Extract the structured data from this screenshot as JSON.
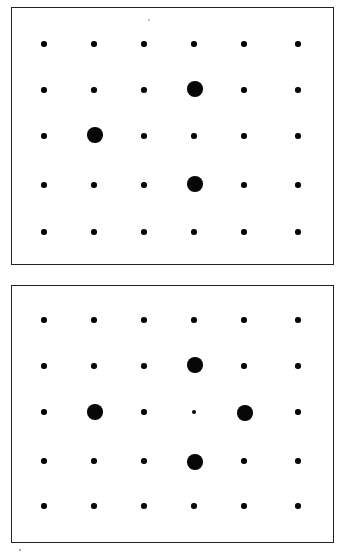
{
  "figure": {
    "title": "Two-panel dot lattice diagram",
    "background_color": "#ffffff",
    "dot_color": "#070707",
    "border_color": "#232323",
    "width": 346,
    "height": 560,
    "panel_count": 2,
    "grid_rows": 5,
    "grid_columns": 6
  },
  "panels": [
    {
      "id": "panel-top",
      "label": "Top panel",
      "frame": {
        "x": 11,
        "y": 7,
        "width": 323,
        "height": 258
      },
      "columns_x": [
        44,
        94,
        144,
        194,
        244,
        298
      ],
      "rows_y": [
        44,
        91,
        138,
        187,
        232
      ],
      "small_dot_diameter": 5.4,
      "large_dot_diameter": 15.5,
      "dots": [
        {
          "row": 1,
          "col": 1,
          "x": 44,
          "y": 44,
          "size": "small"
        },
        {
          "row": 1,
          "col": 2,
          "x": 94,
          "y": 44,
          "size": "small"
        },
        {
          "row": 1,
          "col": 3,
          "x": 144,
          "y": 44,
          "size": "small"
        },
        {
          "row": 1,
          "col": 4,
          "x": 194,
          "y": 44,
          "size": "small"
        },
        {
          "row": 1,
          "col": 5,
          "x": 244,
          "y": 44,
          "size": "small"
        },
        {
          "row": 1,
          "col": 6,
          "x": 298,
          "y": 44,
          "size": "small"
        },
        {
          "row": 2,
          "col": 1,
          "x": 44,
          "y": 90,
          "size": "small"
        },
        {
          "row": 2,
          "col": 2,
          "x": 94,
          "y": 90,
          "size": "small"
        },
        {
          "row": 2,
          "col": 3,
          "x": 144,
          "y": 90,
          "size": "small"
        },
        {
          "row": 2,
          "col": 4,
          "x": 195,
          "y": 89,
          "size": "large"
        },
        {
          "row": 2,
          "col": 5,
          "x": 244,
          "y": 90,
          "size": "small"
        },
        {
          "row": 2,
          "col": 6,
          "x": 298,
          "y": 90,
          "size": "small"
        },
        {
          "row": 3,
          "col": 1,
          "x": 44,
          "y": 136,
          "size": "small"
        },
        {
          "row": 3,
          "col": 2,
          "x": 95,
          "y": 135,
          "size": "large"
        },
        {
          "row": 3,
          "col": 3,
          "x": 144,
          "y": 136,
          "size": "small"
        },
        {
          "row": 3,
          "col": 4,
          "x": 194,
          "y": 136,
          "size": "small"
        },
        {
          "row": 3,
          "col": 5,
          "x": 244,
          "y": 136,
          "size": "small"
        },
        {
          "row": 3,
          "col": 6,
          "x": 298,
          "y": 136,
          "size": "small"
        },
        {
          "row": 4,
          "col": 1,
          "x": 44,
          "y": 185,
          "size": "small"
        },
        {
          "row": 4,
          "col": 2,
          "x": 94,
          "y": 185,
          "size": "small"
        },
        {
          "row": 4,
          "col": 3,
          "x": 144,
          "y": 185,
          "size": "small"
        },
        {
          "row": 4,
          "col": 4,
          "x": 195,
          "y": 184,
          "size": "large"
        },
        {
          "row": 4,
          "col": 5,
          "x": 244,
          "y": 185,
          "size": "small"
        },
        {
          "row": 4,
          "col": 6,
          "x": 298,
          "y": 185,
          "size": "small"
        },
        {
          "row": 5,
          "col": 1,
          "x": 44,
          "y": 232,
          "size": "small"
        },
        {
          "row": 5,
          "col": 2,
          "x": 94,
          "y": 232,
          "size": "small"
        },
        {
          "row": 5,
          "col": 3,
          "x": 144,
          "y": 232,
          "size": "small"
        },
        {
          "row": 5,
          "col": 4,
          "x": 194,
          "y": 232,
          "size": "small"
        },
        {
          "row": 5,
          "col": 5,
          "x": 244,
          "y": 232,
          "size": "small"
        },
        {
          "row": 5,
          "col": 6,
          "x": 298,
          "y": 232,
          "size": "small"
        }
      ],
      "large_dot_positions": [
        {
          "row": 2,
          "col": 4
        },
        {
          "row": 3,
          "col": 2
        },
        {
          "row": 4,
          "col": 4
        }
      ],
      "large_dot_count": 3
    },
    {
      "id": "panel-bottom",
      "label": "Bottom panel",
      "frame": {
        "x": 11,
        "y": 285,
        "width": 323,
        "height": 258
      },
      "columns_x": [
        44,
        94,
        144,
        194,
        244,
        298
      ],
      "rows_y": [
        320,
        366,
        412,
        461,
        506
      ],
      "small_dot_diameter": 5.4,
      "large_dot_diameter": 15.5,
      "dots": [
        {
          "row": 1,
          "col": 1,
          "x": 44,
          "y": 320,
          "size": "small"
        },
        {
          "row": 1,
          "col": 2,
          "x": 94,
          "y": 320,
          "size": "small"
        },
        {
          "row": 1,
          "col": 3,
          "x": 144,
          "y": 320,
          "size": "small"
        },
        {
          "row": 1,
          "col": 4,
          "x": 194,
          "y": 320,
          "size": "small"
        },
        {
          "row": 1,
          "col": 5,
          "x": 244,
          "y": 320,
          "size": "small"
        },
        {
          "row": 1,
          "col": 6,
          "x": 298,
          "y": 320,
          "size": "small"
        },
        {
          "row": 2,
          "col": 1,
          "x": 44,
          "y": 366,
          "size": "small"
        },
        {
          "row": 2,
          "col": 2,
          "x": 94,
          "y": 366,
          "size": "small"
        },
        {
          "row": 2,
          "col": 3,
          "x": 144,
          "y": 366,
          "size": "small"
        },
        {
          "row": 2,
          "col": 4,
          "x": 195,
          "y": 365,
          "size": "large"
        },
        {
          "row": 2,
          "col": 5,
          "x": 244,
          "y": 366,
          "size": "small"
        },
        {
          "row": 2,
          "col": 6,
          "x": 298,
          "y": 366,
          "size": "small"
        },
        {
          "row": 3,
          "col": 1,
          "x": 44,
          "y": 412,
          "size": "small"
        },
        {
          "row": 3,
          "col": 2,
          "x": 95,
          "y": 412,
          "size": "large"
        },
        {
          "row": 3,
          "col": 3,
          "x": 144,
          "y": 412,
          "size": "small"
        },
        {
          "row": 3,
          "col": 4,
          "x": 194,
          "y": 412,
          "size": "tiny"
        },
        {
          "row": 3,
          "col": 5,
          "x": 245,
          "y": 413,
          "size": "large"
        },
        {
          "row": 3,
          "col": 6,
          "x": 298,
          "y": 412,
          "size": "small"
        },
        {
          "row": 4,
          "col": 1,
          "x": 44,
          "y": 461,
          "size": "small"
        },
        {
          "row": 4,
          "col": 2,
          "x": 94,
          "y": 461,
          "size": "small"
        },
        {
          "row": 4,
          "col": 3,
          "x": 144,
          "y": 461,
          "size": "small"
        },
        {
          "row": 4,
          "col": 4,
          "x": 195,
          "y": 462,
          "size": "large"
        },
        {
          "row": 4,
          "col": 5,
          "x": 244,
          "y": 461,
          "size": "small"
        },
        {
          "row": 4,
          "col": 6,
          "x": 298,
          "y": 461,
          "size": "small"
        },
        {
          "row": 5,
          "col": 1,
          "x": 44,
          "y": 506,
          "size": "small"
        },
        {
          "row": 5,
          "col": 2,
          "x": 94,
          "y": 506,
          "size": "small"
        },
        {
          "row": 5,
          "col": 3,
          "x": 144,
          "y": 506,
          "size": "small"
        },
        {
          "row": 5,
          "col": 4,
          "x": 194,
          "y": 506,
          "size": "small"
        },
        {
          "row": 5,
          "col": 5,
          "x": 244,
          "y": 506,
          "size": "small"
        },
        {
          "row": 5,
          "col": 6,
          "x": 298,
          "y": 506,
          "size": "small"
        }
      ],
      "large_dot_positions": [
        {
          "row": 2,
          "col": 4
        },
        {
          "row": 3,
          "col": 2
        },
        {
          "row": 3,
          "col": 5
        },
        {
          "row": 4,
          "col": 4
        }
      ],
      "large_dot_count": 4
    }
  ],
  "artifacts": [
    {
      "id": "speck-bottom-left",
      "x": 20,
      "y": 550,
      "diameter": 2.2,
      "color": "#8a8a8a"
    },
    {
      "id": "speck-top-panel",
      "x": 149,
      "y": 20,
      "diameter": 1.6,
      "color": "#b5b5b5"
    }
  ]
}
